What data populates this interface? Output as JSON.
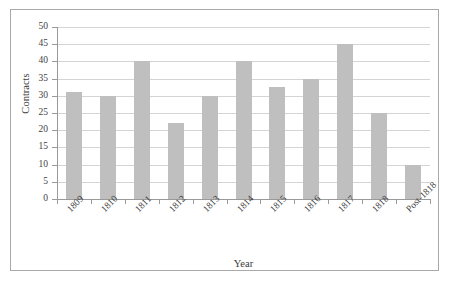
{
  "chart_data": {
    "type": "bar",
    "title": "",
    "xlabel": "Year",
    "ylabel": "Contracts",
    "categories": [
      "1809",
      "1810",
      "1811",
      "1812",
      "1813",
      "1814",
      "1815",
      "1816",
      "1817",
      "1818",
      "Post-1818"
    ],
    "values": [
      31,
      30,
      40,
      22,
      30,
      40,
      32.5,
      35,
      45,
      25,
      10
    ],
    "series": [
      {
        "name": "Contracts",
        "values": [
          31,
          30,
          40,
          22,
          30,
          40,
          32.5,
          35,
          45,
          25,
          10
        ]
      }
    ],
    "ylim": [
      0,
      50
    ],
    "y_ticks": [
      0,
      5,
      10,
      15,
      20,
      25,
      30,
      35,
      40,
      45,
      50
    ],
    "y_tick_labels": [
      "0",
      "5",
      "10",
      "15",
      "20",
      "25",
      "30",
      "35",
      "40",
      "45",
      "50"
    ],
    "grid": true,
    "grid_axis": "y",
    "legend": "none",
    "bar_color": "#bfbfbf",
    "gridline_color": "#d4d4d4",
    "axis_color": "#9a9a9a",
    "frame_color": "#a9a9a9",
    "background_color": "#ffffff",
    "x_label_rotation": -45
  }
}
